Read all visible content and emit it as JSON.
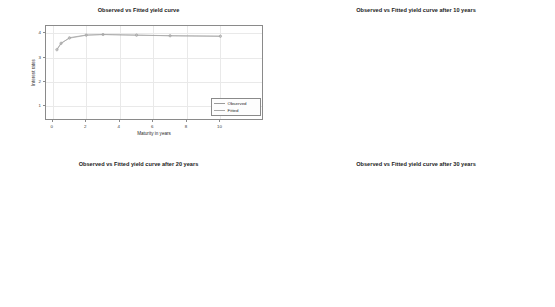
{
  "figure": {
    "background": "#ffffff",
    "observed_color": "#9a9a9a",
    "fitted_color": "#a8a8a8",
    "grid_color": "#e9e9e9",
    "frame_color": "#8a8a8a"
  },
  "common": {
    "xlabel": "Maturity in years",
    "ylabel": "Interest rates",
    "legend": {
      "observed": "Observed",
      "fitted": "Fitted"
    }
  },
  "chart_data": [
    {
      "id": "panel-current",
      "type": "line",
      "title": "Observed vs Fitted yield curve",
      "xlabel": "Maturity in years",
      "ylabel": "Interest rates",
      "xlim": [
        -0.4,
        12.6
      ],
      "ylim": [
        0.4,
        4.3
      ],
      "xticks": [
        0,
        2,
        4,
        6,
        8,
        10
      ],
      "yticks": [
        1,
        2,
        3,
        4
      ],
      "grid": true,
      "legend_position": "bottom-right",
      "x": [
        0.25,
        0.5,
        1,
        2,
        3,
        5,
        7,
        10
      ],
      "series": [
        {
          "name": "Observed",
          "values": [
            3.32,
            3.58,
            3.82,
            3.93,
            3.95,
            3.92,
            3.9,
            3.88
          ]
        },
        {
          "name": "Fitted",
          "values": [
            3.34,
            3.6,
            3.8,
            3.92,
            3.95,
            3.93,
            3.9,
            3.88
          ]
        }
      ]
    },
    {
      "id": "panel-10y",
      "type": "line",
      "title": "Observed vs Fitted yield curve after 10 years",
      "xlabel": "Maturity in years",
      "ylabel": "Interest rates",
      "xlim": [
        -0.4,
        10.6
      ],
      "ylim": [
        0,
        11
      ],
      "xticks": [
        0,
        2,
        4,
        6,
        8,
        10
      ],
      "yticks": [
        5,
        10
      ],
      "grid": true,
      "legend_position": "bottom-right",
      "x": [
        0.25,
        0.5,
        1,
        2,
        3,
        5,
        7,
        10
      ],
      "series": [
        {
          "name": "Observed",
          "values": [
            3.3,
            3.5,
            3.75,
            4.1,
            4.4,
            4.9,
            5.3,
            5.9
          ]
        },
        {
          "name": "Fitted",
          "values": [
            3.32,
            3.52,
            3.77,
            4.12,
            4.42,
            4.92,
            5.32,
            5.9
          ]
        }
      ]
    },
    {
      "id": "panel-20y",
      "type": "line",
      "title": "Observed vs Fitted yield curve after 20 years",
      "xlabel": "Maturity in years",
      "ylabel": "Interest rates",
      "xlim": [
        -0.4,
        10.6
      ],
      "ylim": [
        0,
        11
      ],
      "xticks": [
        0,
        2,
        4,
        6,
        8,
        10
      ],
      "yticks": [
        5,
        10
      ],
      "grid": true,
      "legend_position": "top-right",
      "x": [
        0.25,
        0.5,
        1,
        2,
        3,
        5,
        7,
        10
      ],
      "series": [
        {
          "name": "Observed",
          "values": [
            1.1,
            1.25,
            1.5,
            2.0,
            2.3,
            2.75,
            3.0,
            3.1
          ]
        },
        {
          "name": "Fitted",
          "values": [
            1.12,
            1.27,
            1.52,
            2.0,
            2.32,
            2.76,
            3.0,
            3.1
          ]
        }
      ]
    },
    {
      "id": "panel-30y",
      "type": "line",
      "title": "Observed vs Fitted yield curve after 30 years",
      "xlabel": "Maturity in years",
      "ylabel": "Interest rates",
      "xlim": [
        -0.4,
        10.6
      ],
      "ylim": [
        0,
        11
      ],
      "xticks": [
        0,
        2,
        4,
        6,
        8,
        10
      ],
      "yticks": [
        5,
        10
      ],
      "grid": true,
      "legend_position": "top-right",
      "x": [
        0.25,
        0.5,
        1,
        2,
        3,
        5,
        7,
        10
      ],
      "series": [
        {
          "name": "Observed",
          "values": [
            0.18,
            0.22,
            0.3,
            0.45,
            0.6,
            0.85,
            1.1,
            1.35
          ]
        },
        {
          "name": "Fitted",
          "values": [
            0.19,
            0.23,
            0.31,
            0.46,
            0.61,
            0.86,
            1.1,
            1.35
          ]
        }
      ]
    }
  ]
}
